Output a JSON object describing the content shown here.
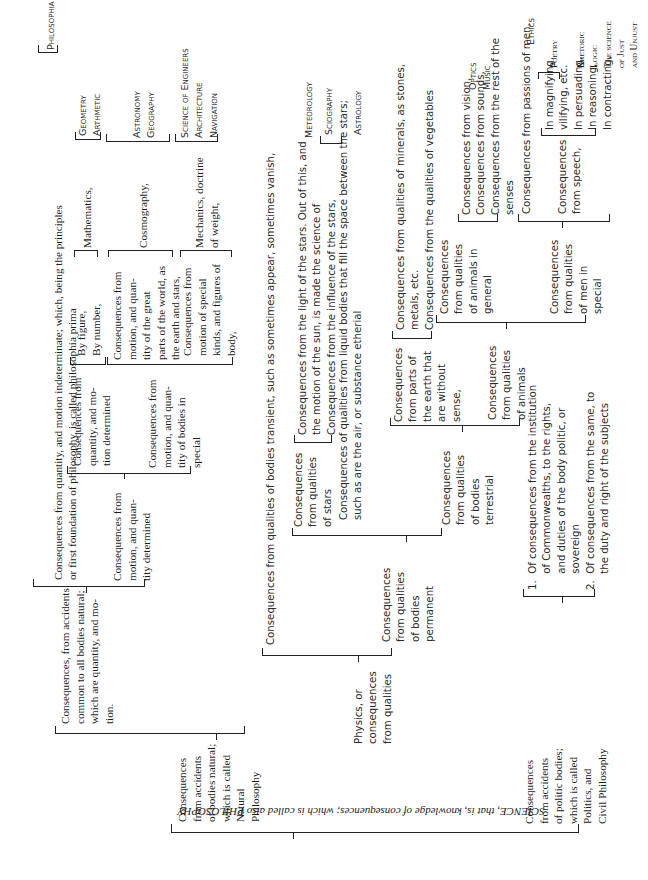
{
  "document": {
    "title": "SCIENCE, that is, knowledge of consequences; which is called also PHILOSOPHY",
    "orientation": "rotated 90 degrees counter-clockwise; caption upside-down",
    "root_caption": "SCIENCE, that is, knowledge of consequences; which is called also PHILOSOPHY"
  },
  "natural": {
    "label": "Consequences\nfrom accidents\nof bodies natural;\nwhich is called\nNatural\nPhilosophy",
    "common": "Consequences, from accidents\ncommon to all bodies natural;\nwhich are quantity, and mo-\ntion.",
    "prima": "Consequences from quantity, and motion indeterminate; which, being the principles\nor first foundation of philosophy, is called philosophia prima",
    "prima_leaf": "Philosophia Prima",
    "determined": "Consequences from\nmotion, and quan-\ntity determined",
    "qty_motion": "Consequences from\nquantity, and mo-\ntion determined",
    "by_fig_num": "By figure,\nBy number,",
    "mathematics": "Mathematics,",
    "math_leaves": "Geometry\nArthmetic",
    "bodies_special": "Consequences from\nmotion, and quan-\ntity of bodies in\nspecial",
    "great_parts": "Consequences from\nmotion, and quan-\ntity of the great\nparts of the world, as\nthe earth and stars,",
    "cosmography": "Cosmography,",
    "cosmo_leaves": "Astronomy\nGeography",
    "special_kinds": "Consequences from\nmotion of special\nkinds, and figures of\nbody,",
    "mechanics": "Mechanics, doctrine\nof weight,",
    "mech_leaves": "Science of Engineers\nArchitecture\nNavigation",
    "physics": "Physics, or\nconsequences\nfrom qualities",
    "transient": "Consequences from qualities of bodies transient, such as sometimes appear, sometimes vanish,",
    "meteorology": "Meteorology",
    "permanent": "Consequences\nfrom qualities\nof bodies\npermanent",
    "stars": "Consequences\nfrom qualities\nof stars",
    "star_items": "Consequences from the light of the stars. Out of this, and\nthe motion of the sun, is made the science of\nConsequences from the influence of the stars,",
    "star_leaves": "Sciography\n\nAstrology",
    "liquid": "Consequences of qualities from liquid bodies that fill the space between the stars;\nsuch as are the air, or substance etherial",
    "terrestrial": "Consequences\nfrom qualities\nof bodies\nterrestrial",
    "without_sense": "Consequences\nfrom parts of\nthe earth that\nare without\nsense,",
    "minerals": "Consequences from qualities of minerals, as stones,\nmetals, etc.\nConsequences from the qualities of vegetables",
    "animals": "Consequences\nfrom qualities\nof animals",
    "animals_general": "Consequences\nfrom qualities\nof animals in\ngeneral",
    "senses": "Consequences from vision,\nConsequences from sounds,\nConsequences from the rest of the\nsenses",
    "senses_leaves": "Optics\nMusic",
    "men_special": "Consequences\nfrom qualities\nof men in\nspecial",
    "passions": "Consequences from passions of men,",
    "ethics": "Ethics",
    "speech": "Consequences\nfrom speech,",
    "speech_items": "In magnifying,\nvilifying, etc.\nIn persuading,\nIn reasoning,\nIn contracting,",
    "speech_leaves": "Poetry\n\nRhetoric\nLogic\nThe science\nof Just\nand Unjust"
  },
  "politic": {
    "label": "Consequences\nfrom accidents\nof politic bodies;\nwhich is called\nPolitics, and\nCivil Philosophy",
    "items": "1.  Of consequences from the institution\n     of Commonwealths, to the rights,\n     and duties of the body politic, or\n     sovereign\n2.  Of consequences from the same, to\n     the duty and right of the subjects"
  }
}
